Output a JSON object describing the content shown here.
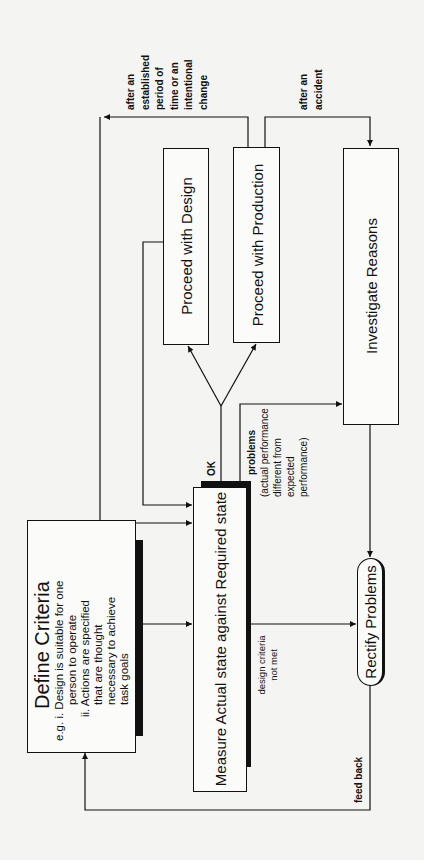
{
  "diagram": {
    "orientation": "rotated 90° counter-clockwise",
    "nodes": {
      "define_criteria": {
        "title": "Define Criteria",
        "line1": "e.g. i. Design is suitable for one",
        "line2": "person to operate",
        "line3": "ii. Actions are specified",
        "line4": "that are thought",
        "line5": "necessary to achieve",
        "line6": "task goals"
      },
      "measure": {
        "label": "Measure Actual state against Required state"
      },
      "proceed_design": {
        "label": "Proceed with Design"
      },
      "proceed_production": {
        "label": "Proceed with Production"
      },
      "investigate": {
        "label": "Investigate Reasons"
      },
      "rectify": {
        "label": "Rectify Problems"
      }
    },
    "edge_labels": {
      "ok": "OK",
      "problems": "problems",
      "problems_detail_1": "(actual performance",
      "problems_detail_2": "different from",
      "problems_detail_3": "expected",
      "problems_detail_4": "performance)",
      "criteria_not_met_1": "design criteria",
      "criteria_not_met_2": "not met",
      "feedback": "feed back",
      "established_1": "after an",
      "established_2": "established",
      "established_3": "period of",
      "established_4": "time or an",
      "established_5": "intentional",
      "established_6": "change",
      "accident_1": "after an",
      "accident_2": "accident"
    },
    "colors": {
      "ink": "#111111",
      "paper": "#f4f4f2"
    }
  }
}
